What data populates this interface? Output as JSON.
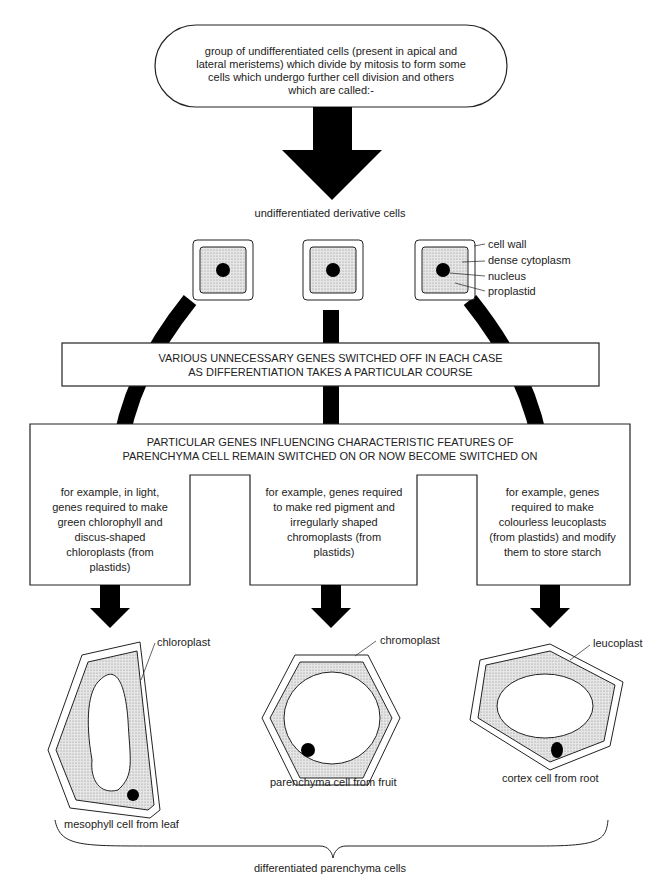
{
  "top_box": {
    "text": "group of undifferentiated cells (present in apical and lateral meristems) which divide by mitosis to form some cells which undergo further cell division and others which are called:-"
  },
  "derivative_label": "undifferentiated derivative cells",
  "cell_labels": {
    "cell_wall": "cell wall",
    "dense_cytoplasm": "dense cytoplasm",
    "nucleus": "nucleus",
    "proplastid": "proplastid"
  },
  "genes_off_box": {
    "line1": "VARIOUS UNNECESSARY GENES SWITCHED OFF IN EACH CASE",
    "line2": "AS DIFFERENTIATION TAKES A PARTICULAR COURSE"
  },
  "genes_on_box": {
    "line1": "PARTICULAR GENES INFLUENCING CHARACTERISTIC FEATURES OF",
    "line2": "PARENCHYMA CELL REMAIN SWITCHED ON OR NOW BECOME SWITCHED ON"
  },
  "examples": [
    {
      "text": "for example, in light, genes required to make green chlorophyll and discus-shaped chloroplasts (from plastids)"
    },
    {
      "text": "for example, genes required to make red pigment and irregularly shaped chromoplasts (from plastids)"
    },
    {
      "text": "for example, genes required to make colourless leucoplasts (from plastids) and modify them to store starch"
    }
  ],
  "cells": [
    {
      "organelle": "chloroplast",
      "caption": "mesophyll cell from leaf"
    },
    {
      "organelle": "chromoplast",
      "caption": "parenchyma cell from fruit"
    },
    {
      "organelle": "leucoplast",
      "caption": "cortex cell from root"
    }
  ],
  "bottom_label": "differentiated parenchyma cells"
}
